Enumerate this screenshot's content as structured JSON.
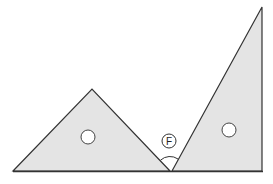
{
  "diagram": {
    "colors": {
      "fill": "#e4e4e4",
      "stroke": "#333333",
      "background": "#ffffff"
    },
    "shapes": [
      {
        "name": "isosceles-right-triangle",
        "points": [
          [
            13,
            171
          ],
          [
            92,
            89
          ],
          [
            170,
            171
          ]
        ],
        "hole": [
          88,
          137
        ]
      },
      {
        "name": "30-60-90-triangle",
        "points": [
          [
            172,
            171
          ],
          [
            262,
            7
          ],
          [
            262,
            171
          ]
        ],
        "hole": [
          229,
          130
        ]
      }
    ],
    "angle_label": {
      "text": "F",
      "position": [
        169,
        141
      ],
      "vertex": [
        171,
        171
      ]
    }
  }
}
